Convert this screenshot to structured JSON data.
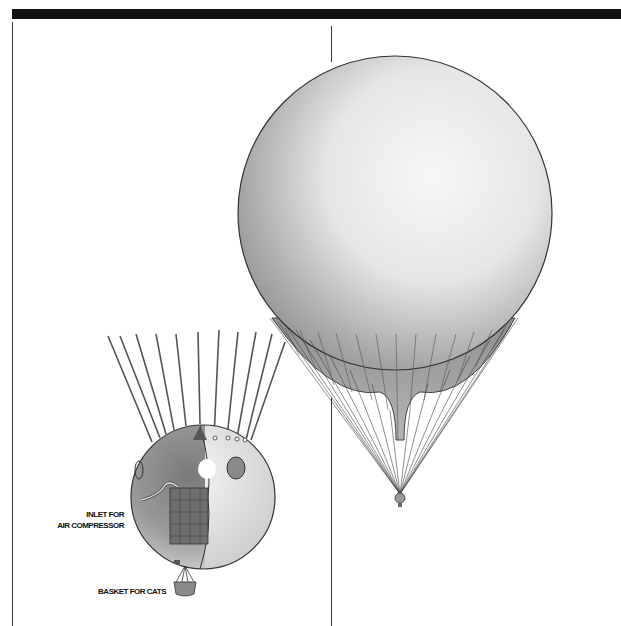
{
  "figure": {
    "labels": {
      "inlet_line1": "INLET FOR",
      "inlet_line2": "AIR COMPRESSOR",
      "basket": "BASKET FOR CATS"
    },
    "colors": {
      "bar": "#111111",
      "line": "#333333",
      "balloon_light": "#f4f4f4",
      "balloon_dark": "#7a7a7a"
    }
  }
}
